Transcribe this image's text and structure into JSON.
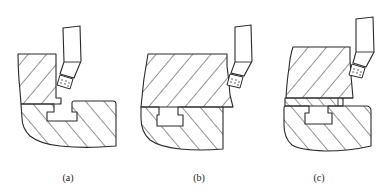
{
  "figure": {
    "panels": [
      {
        "id": "a",
        "label": "(a)"
      },
      {
        "id": "b",
        "label": "(b)"
      },
      {
        "id": "c",
        "label": "(c)"
      }
    ],
    "colors": {
      "line": "#2a2a2a",
      "background": "#ffffff"
    }
  }
}
